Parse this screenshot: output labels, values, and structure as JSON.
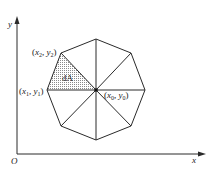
{
  "diagram": {
    "type": "geometry",
    "axes": {
      "origin_label": "O",
      "x_label": "x",
      "y_label": "y"
    },
    "points": {
      "center": {
        "name": "x",
        "sub": "0",
        "name2": "y",
        "sub2": "0"
      },
      "p1": {
        "name": "x",
        "sub": "1",
        "name2": "y",
        "sub2": "1"
      },
      "p2": {
        "name": "x",
        "sub": "2",
        "name2": "y",
        "sub2": "2"
      }
    },
    "labels": {
      "center": "(x0, y0)",
      "p1": "(x1, y1)",
      "p2": "(x2, y2)",
      "area_element": "dA"
    },
    "colors": {
      "line": "#2a2a2a",
      "hatch": "#555555",
      "background": "#ffffff"
    },
    "octagon_sides": 8,
    "triangles": 8,
    "shaded_triangle": "center-p1-p2"
  }
}
